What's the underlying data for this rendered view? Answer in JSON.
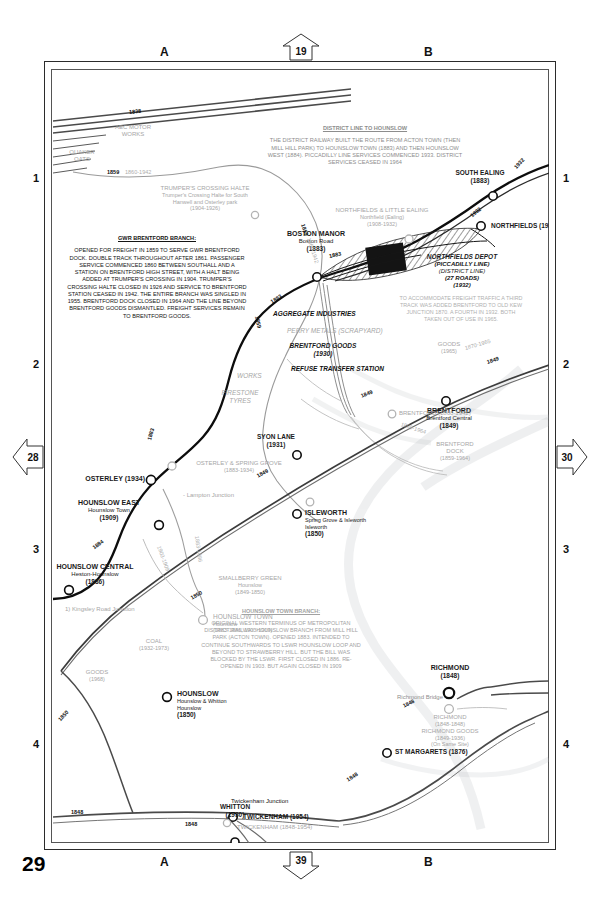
{
  "page": {
    "number": "29",
    "grid_rows": [
      "1",
      "2",
      "3",
      "4"
    ],
    "grid_cols": [
      "A",
      "B"
    ],
    "arrows": {
      "top": "19",
      "bottom": "39",
      "left": "28",
      "right": "30"
    }
  },
  "notes": [
    {
      "id": "district-line",
      "heading": "DISTRICT LINE TO HOUNSLOW",
      "body": "THE DISTRICT RAILWAY BUILT THE ROUTE FROM ACTON TOWN (THEN MILL HILL PARK) TO HOUNSLOW TOWN (1883) AND THEN HOUNSLOW WEST (1884). PICCADILLY LINE SERVICES COMMENCED 1933. DISTRICT SERVICES CEASED IN 1964"
    },
    {
      "id": "gwr-brentford",
      "heading": "GWR BRENTFORD BRANCH:",
      "body": "OPENED FOR FREIGHT IN 1859 TO SERVE GWR BRENTFORD DOCK. DOUBLE TRACK THROUGHOUT AFTER 1861. PASSENGER SERVICE COMMENCED 1860 BETWEEN SOUTHALL AND A STATION ON BRENTFORD HIGH STREET, WITH A HALT BEING ADDED AT TRUMPER'S CROSSING IN 1904. TRUMPER'S CROSSING HALTE CLOSED IN 1926 AND SERVICE TO BRENTFORD STATION CEASED IN 1942. THE ENTIRE BRANCH WAS SINGLED IN 1955. BRENTFORD DOCK CLOSED IN 1964 AND THE LINE BEYOND BRENTFORD GOODS DISMANTLED. FREIGHT SERVICES REMAIN TO BRENTFORD GOODS."
    },
    {
      "id": "third-track",
      "heading": "",
      "body": "TO ACCOMMODATE FREIGHT TRAFFIC A THIRD TRACK WAS ADDED BRENTFORD TO OLD KEW JUNCTION 1870. A FOURTH IN 1932. BOTH TAKEN OUT OF USE IN 1965."
    },
    {
      "id": "hounslow-town-branch",
      "heading": "HOUNSLOW TOWN BRANCH:",
      "body": "ORIGINAL WESTERN TERMINUS OF METROPOLITAN DISTRICT RAILWAY HOUNSLOW BRANCH FROM MILL HILL PARK (ACTON TOWN). OPENED 1883. INTENDED TO CONTINUE SOUTHWARDS TO LSWR HOUNSLOW LOOP AND BEYOND TO STRAWBERRY HILL. BUT THE BILL WAS BLOCKED BY THE LSWR. FIRST CLOSED IN 1886. RE-OPENED IN 1903. BUT AGAIN CLOSED IN 1909"
    }
  ],
  "stations": [
    {
      "id": "south-ealing",
      "name": "SOUTH EALING",
      "alt": "",
      "years": "(1883)"
    },
    {
      "id": "northfields",
      "name": "NORTHFIELDS (1932)",
      "alt": "",
      "years": ""
    },
    {
      "id": "northfields-little-ealing",
      "name": "NORTHFIELDS & LITTLE EALING",
      "alt": "Northfield (Ealing)",
      "years": "(1908-1932)"
    },
    {
      "id": "boston-manor",
      "name": "BOSTON MANOR",
      "alt": "Boston Road",
      "years": "(1883)"
    },
    {
      "id": "brentford",
      "name": "BRENTFORD",
      "alt": "Brentford Central",
      "years": "(1849)"
    },
    {
      "id": "brentford-old",
      "name": "BRENTFORD (1860-1942)",
      "alt": "",
      "years": ""
    },
    {
      "id": "syon-lane",
      "name": "SYON LANE",
      "alt": "",
      "years": "(1931)"
    },
    {
      "id": "isleworth",
      "name": "ISLEWORTH",
      "alt": "Spring Grove & Isleworth\nIsleworth",
      "years": "(1850)"
    },
    {
      "id": "osterley",
      "name": "OSTERLEY (1934)",
      "alt": "",
      "years": ""
    },
    {
      "id": "osterley-spring-grove",
      "name": "OSTERLEY & SPRING GROVE",
      "alt": "",
      "years": "(1883-1934)"
    },
    {
      "id": "smallberry-green",
      "name": "SMALLBERRY GREEN",
      "alt": "Hounslow",
      "years": "(1849-1850)"
    },
    {
      "id": "hounslow-east",
      "name": "HOUNSLOW EAST",
      "alt": "Hounslow Town",
      "years": "(1909)"
    },
    {
      "id": "hounslow-central",
      "name": "HOUNSLOW CENTRAL",
      "alt": "Heston-Hounslow",
      "years": "(1886)"
    },
    {
      "id": "hounslow-town",
      "name": "HOUNSLOW TOWN",
      "alt": "Hounslow",
      "years": "(1883-1886, 1903-1909)"
    },
    {
      "id": "hounslow",
      "name": "HOUNSLOW",
      "alt": "Hounslow & Whitton\nHounslow",
      "years": "(1850)"
    },
    {
      "id": "whitton",
      "name": "WHITTON",
      "alt": "",
      "years": "(1930)"
    },
    {
      "id": "twickenham",
      "name": "TWICKENHAM (1954)",
      "alt": "",
      "years": ""
    },
    {
      "id": "twickenham-old",
      "name": "TWICKENHAM (1848-1954)",
      "alt": "",
      "years": ""
    },
    {
      "id": "st-margarets",
      "name": "ST MARGARETS (1876)",
      "alt": "",
      "years": ""
    },
    {
      "id": "richmond",
      "name": "RICHMOND",
      "alt": "",
      "years": "(1848)"
    },
    {
      "id": "richmond-old",
      "name": "RICHMOND",
      "alt": "RICHMOND GOODS",
      "years": "(1848-1848)\n(1849-1936)\n(On Same Site)"
    }
  ],
  "features": [
    {
      "id": "aec-motor-works",
      "label": "AEC MOTOR\nWORKS"
    },
    {
      "id": "quaker-oats",
      "label": "QUAKER\nOATS"
    },
    {
      "id": "trumpers-crossing",
      "label": "TRUMPER'S CROSSING HALTE",
      "sub": "Trumper's Crossing Halte for South\nHanwell and Osterley park\n(1904-1926)"
    },
    {
      "id": "northfields-depot",
      "label": "NORTHFIELDS DEPOT",
      "sub": "(PICCADILLY LINE)\n(DISTRICT LINE)\n(27 ROADS)\n(1932)"
    },
    {
      "id": "aggregate-industries",
      "label": "AGGREGATE INDUSTRIES"
    },
    {
      "id": "perry-metals",
      "label": "PERRY METALS (SCRAPYARD)"
    },
    {
      "id": "brentford-goods",
      "label": "BRENTFORD GOODS",
      "sub": "(1930)"
    },
    {
      "id": "refuse-transfer",
      "label": "REFUSE TRANSFER STATION"
    },
    {
      "id": "works",
      "label": "WORKS"
    },
    {
      "id": "firestone-tyres",
      "label": "FIRESTONE\nTYRES"
    },
    {
      "id": "goods-1965",
      "label": "GOODS",
      "sub": "(1965)"
    },
    {
      "id": "brentford-dock",
      "label": "BRENTFORD\nDOCK",
      "sub": "(1859-1964)"
    },
    {
      "id": "lampton-junction",
      "label": "- Lampton Junction"
    },
    {
      "id": "kingsley-road-junction",
      "label": "1) Kingsley Road Junction"
    },
    {
      "id": "coal",
      "label": "COAL",
      "sub": "(1932-1973)"
    },
    {
      "id": "goods-1968",
      "label": "GOODS",
      "sub": "(1968)"
    },
    {
      "id": "richmond-bridge",
      "label": "Richmond Bridge"
    },
    {
      "id": "twickenham-junction",
      "label": "Twickenham Junction"
    }
  ],
  "year_tags": [
    {
      "id": "y1838",
      "text": "1838"
    },
    {
      "id": "y1859a",
      "text": "1859"
    },
    {
      "id": "y1860-1942",
      "text": "1860-1942"
    },
    {
      "id": "y1859b",
      "text": "1859"
    },
    {
      "id": "y1860-1942b",
      "text": "1860-1942"
    },
    {
      "id": "y1859c",
      "text": "1859"
    },
    {
      "id": "y1883a",
      "text": "1883"
    },
    {
      "id": "y1883b",
      "text": "1883"
    },
    {
      "id": "y1883c",
      "text": "1883"
    },
    {
      "id": "y1932a",
      "text": "1932"
    },
    {
      "id": "y1932b",
      "text": "1932"
    },
    {
      "id": "y1849a",
      "text": "1849"
    },
    {
      "id": "y1849b",
      "text": "1849"
    },
    {
      "id": "y1849c",
      "text": "1849"
    },
    {
      "id": "y1870-1965",
      "text": "1870-1965"
    },
    {
      "id": "y1859-1964",
      "text": "1859-1964"
    },
    {
      "id": "y1884",
      "text": "1884"
    },
    {
      "id": "y1883-1886",
      "text": "1883-1886"
    },
    {
      "id": "y1903-1909",
      "text": "1903-1909"
    },
    {
      "id": "y1850",
      "text": "1850"
    },
    {
      "id": "y1850b",
      "text": "1850"
    },
    {
      "id": "y1848a",
      "text": "1848"
    },
    {
      "id": "y1848b",
      "text": "1848"
    },
    {
      "id": "y1848c",
      "text": "1848"
    },
    {
      "id": "y1848d",
      "text": "1848"
    }
  ],
  "colors": {
    "ink": "#111111",
    "pale": "#adadad",
    "mid": "#8e8e8e",
    "frame": "#2b2b2b",
    "paper": "#ffffff"
  }
}
